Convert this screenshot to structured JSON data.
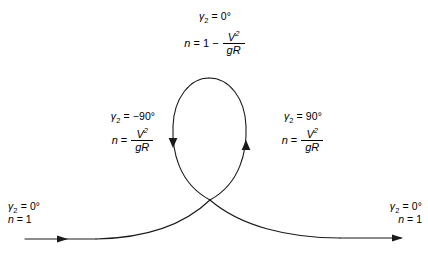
{
  "figure": {
    "background_color": "#ffffff",
    "stroke_color": "#1a1a1a"
  },
  "annotations": {
    "top": {
      "gamma_symbol": "γ",
      "gamma_sub": "2",
      "gamma_eq": "= 0°",
      "n_label": "n",
      "n_eq": "= 1 −",
      "numerator": "V",
      "numerator_exp": "2",
      "denominator": "gR"
    },
    "left": {
      "gamma_symbol": "γ",
      "gamma_sub": "2",
      "gamma_eq": "= −90°",
      "n_label": "n",
      "n_eq": "=",
      "numerator": "V",
      "numerator_exp": "2",
      "denominator": "gR"
    },
    "right": {
      "gamma_symbol": "γ",
      "gamma_sub": "2",
      "gamma_eq": "= 90°",
      "n_label": "n",
      "n_eq": "=",
      "numerator": "V",
      "numerator_exp": "2",
      "denominator": "gR"
    },
    "entry": {
      "gamma_symbol": "γ",
      "gamma_sub": "2",
      "gamma_eq": "= 0°",
      "n_label": "n",
      "n_eq": "= 1"
    },
    "exit": {
      "gamma_symbol": "γ",
      "gamma_sub": "2",
      "gamma_eq": "= 0°",
      "n_label": "n",
      "n_eq": "= 1"
    }
  }
}
